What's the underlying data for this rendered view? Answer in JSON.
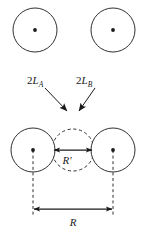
{
  "figure": {
    "type": "physics-diagram",
    "background_color": "#ffffff",
    "stroke_color": "#1a1a1a",
    "labels": {
      "left_body": {
        "prefix": "2L",
        "subscript": "A",
        "full": "2L_A"
      },
      "right_body": {
        "prefix": "2L",
        "subscript": "B",
        "full": "2L_B"
      },
      "inner_separation": {
        "text": "R",
        "prime": "′",
        "full": "R′"
      },
      "center_separation": {
        "text": "R",
        "full": "R"
      }
    },
    "circles": {
      "top_left": {
        "cx": 35,
        "cy": 30,
        "r": 22,
        "style": "solid",
        "center_dot": true
      },
      "top_right": {
        "cx": 113,
        "cy": 30,
        "r": 22,
        "style": "solid",
        "center_dot": true
      },
      "bottom_left": {
        "cx": 33,
        "cy": 150,
        "r": 22,
        "style": "solid",
        "center_dot": true
      },
      "bottom_right": {
        "cx": 113,
        "cy": 150,
        "r": 22,
        "style": "solid",
        "center_dot": true
      },
      "middle_dashed": {
        "cx": 73,
        "cy": 150,
        "r": 21,
        "style": "dashed",
        "center_dot": false
      }
    },
    "pointer_arrows": {
      "left": {
        "x1": 45,
        "y1": 88,
        "x2": 68,
        "y2": 112
      },
      "right": {
        "x1": 95,
        "y1": 88,
        "x2": 78,
        "y2": 112
      }
    },
    "dimension_arrows": {
      "inner": {
        "x1": 53,
        "x2": 93,
        "y": 150,
        "double_headed": true
      },
      "outer": {
        "x1": 33,
        "x2": 113,
        "y": 209,
        "double_headed": true
      }
    },
    "guide_lines": {
      "left": {
        "x": 33,
        "y1": 150,
        "y2": 214,
        "style": "dashed"
      },
      "right": {
        "x": 113,
        "y1": 150,
        "y2": 214,
        "style": "dashed"
      }
    }
  }
}
